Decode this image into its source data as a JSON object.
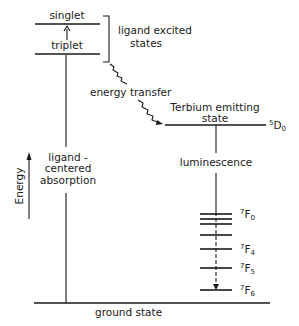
{
  "diagram": {
    "type": "energy-level diagram",
    "ligand_levels": {
      "singlet": "singlet",
      "triplet": "triplet",
      "bracket_label_line1": "ligand excited",
      "bracket_label_line2": "states"
    },
    "energy_transfer_label": "energy transfer",
    "terbium": {
      "label_line1": "Terbium emitting",
      "label_line2": "state",
      "level_sup": "5",
      "level_main": "D",
      "level_sub": "0"
    },
    "luminescence_label": "luminescence",
    "absorption": {
      "line1": "ligand -",
      "line2": "centered",
      "line3": "absorption"
    },
    "axis_label": "Energy",
    "f_levels": [
      {
        "sup": "7",
        "main": "F",
        "sub": "0"
      },
      {
        "sup": "7",
        "main": "F",
        "sub": "4"
      },
      {
        "sup": "7",
        "main": "F",
        "sub": "5"
      },
      {
        "sup": "7",
        "main": "F",
        "sub": "6"
      }
    ],
    "ground_state_label": "ground state"
  }
}
